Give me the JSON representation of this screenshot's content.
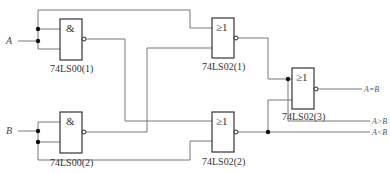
{
  "diagram": {
    "type": "logic-circuit",
    "inputs": [
      {
        "name": "A",
        "label": "A"
      },
      {
        "name": "B",
        "label": "B"
      }
    ],
    "gates": [
      {
        "id": "nand1",
        "type": "NAND",
        "symbol": "&",
        "label": "74LS00(1)",
        "inputs": [
          "A",
          "A"
        ],
        "output": "A'"
      },
      {
        "id": "nand2",
        "type": "NAND",
        "symbol": "&",
        "label": "74LS00(2)",
        "inputs": [
          "B",
          "B"
        ],
        "output": "B'"
      },
      {
        "id": "nor1",
        "type": "NOR",
        "symbol": "≥1",
        "label": "74LS02(1)",
        "inputs": [
          "A",
          "B'"
        ],
        "output": "A>B"
      },
      {
        "id": "nor2",
        "type": "NOR",
        "symbol": "≥1",
        "label": "74LS02(2)",
        "inputs": [
          "A'",
          "B"
        ],
        "output": "A<B"
      },
      {
        "id": "nor3",
        "type": "NOR",
        "symbol": "≥1",
        "label": "74LS02(3)",
        "inputs": [
          "A>B",
          "A<B"
        ],
        "output": "A=B"
      }
    ],
    "outputs": [
      {
        "name": "eq",
        "label": "A=B"
      },
      {
        "name": "gt",
        "label": "A>B"
      },
      {
        "name": "lt",
        "label": "A<B"
      }
    ]
  }
}
